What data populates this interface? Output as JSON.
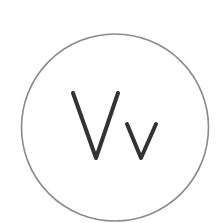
{
  "logo": {
    "text": "Vv",
    "icon": "font-size-icon",
    "colors": {
      "background": "#ffffff",
      "circle_stroke": "#8a8a8a",
      "glyph_stroke": "#333333"
    }
  }
}
